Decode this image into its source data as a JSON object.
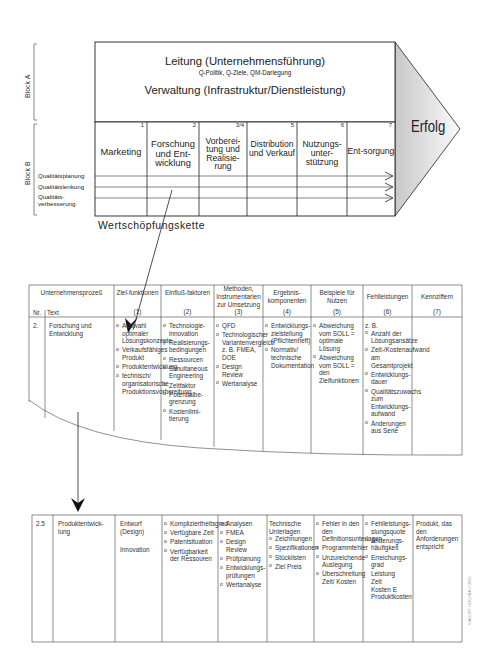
{
  "block_labels": {
    "a": "Block A",
    "b": "Block B"
  },
  "block_a": {
    "title_1": "Leitung (Unternehmensführung)",
    "subtitle": "Q-Politik, Q-Ziele, QM-Darlegung",
    "title_2": "Verwaltung (Infrastruktur/Dienstleistung)"
  },
  "arrow_head_label": "Erfolg",
  "block_b": {
    "columns": [
      {
        "num": "1",
        "title": "Marketing"
      },
      {
        "num": "2",
        "title": "Forschung und Ent-wicklung"
      },
      {
        "num": "3/4",
        "title": "Vorberei-tung und Realisie-rung"
      },
      {
        "num": "5",
        "title": "Distribution und Verkauf"
      },
      {
        "num": "6",
        "title": "Nutzungs-unter-stützung"
      },
      {
        "num": "7",
        "title": "Ent-sorgung"
      }
    ],
    "quality_rows": [
      "Qualitätsplanung",
      "Qualitätslenkung",
      "Qualitäts-verbesserung"
    ]
  },
  "chain_label": "Wertschöpfungskette",
  "table1": {
    "header": {
      "process": "Unternehmensprozeß",
      "nr": "Nr.",
      "text": "Text",
      "columns": [
        {
          "title": "Ziel-funktionen",
          "num": "(1)"
        },
        {
          "title": "Einfluß-faktoren",
          "num": "(2)"
        },
        {
          "title": "Methoden, Instrumentarien zur Umsetzung",
          "num": "(3)"
        },
        {
          "title": "Ergebnis-komponenten",
          "num": "(4)"
        },
        {
          "title": "Beispiele für Nutzen",
          "num": "(5)"
        },
        {
          "title": "Fehlleistungen",
          "num": "(6)"
        },
        {
          "title": "Kennziffern",
          "num": "(7)"
        }
      ]
    },
    "row": {
      "nr": "2.",
      "text": "Forschung und Entwicklung",
      "col1": [
        "Auswahl optimaler Lösungskonzepte",
        "Verkaufsfähiges Produkt",
        "Produktentwicklung",
        "technisch/ organisatorische Produktionsvorbereitung"
      ],
      "col2": [
        "Technologie-innovation",
        "Realisierungs-bedingungen",
        "Ressourcen",
        "Simultaneous Engineering",
        "Zeitfaktor",
        "Potentialbe-grenzung",
        "Kostenlimi-tierung"
      ],
      "col3": [
        "QFD",
        "Technologischer Variantenvergleich z. B. FMEA, DOE",
        "Design Review",
        "Wertanalyse"
      ],
      "col4": [
        "Entwicklungs-zielstellung (Pflichtenheft)",
        "Normativ/ technische Dokumentation"
      ],
      "col5": [
        "Abweichung vom SOLL = optimale Lösung",
        "Abweichung vom SOLL = den Zielfunktionen"
      ],
      "col6_intro": "z. B.",
      "col6": [
        "Anzahl der Lösungsansätze",
        "Zeit-/Kostenaufwand am Gesamtprojekt",
        "Entwicklungs-dauer",
        "Qualitätszuwachs zum Entwicklungs-aufwand",
        "Änderungen aus Serie"
      ],
      "col7": ""
    }
  },
  "table2": {
    "row": {
      "nr": "2.5",
      "text": "Produktentwick-lung",
      "col1_line1": "Entwurf (Design)",
      "col1_line2": "Innovation",
      "col2": [
        "Kompliziertheitsgrad",
        "Verfügbare Zeit",
        "Patentsituation",
        "Verfügbarkeit der Ressouren"
      ],
      "col3": [
        "Analysen",
        "FMEA",
        "Design Review",
        "Prüfplanung",
        "Entwicklungs-prüfungen",
        "Wertanalyse"
      ],
      "col4_intro": "Technische Unterlagen",
      "col4": [
        "Zeichnungen",
        "Spezifikationen",
        "Stücklisten",
        "Ziel Preis"
      ],
      "col5": [
        "Fehler in den den Definitionsunterlagen",
        "Programmfehler",
        "Unzureichende Auslegung",
        "Überschreitung Zeit/ Kosten"
      ],
      "col6": [
        "Fehlleistungs-slungsquote",
        "Änderungs-häufigkeit",
        "Erreichungs-grad"
      ],
      "col6_extra": [
        "Leistung",
        "Zeit",
        "Kosten E",
        "Produktkosten"
      ],
      "col7": "Produkt, das den Anforderungen entspricht"
    }
  },
  "side_note": "VIADUKT HOCHBAU ORIV"
}
